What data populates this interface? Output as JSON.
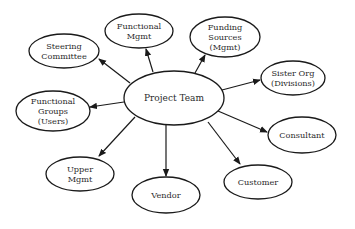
{
  "diagram": {
    "title": "",
    "background": "#ffffff",
    "stroke_color": "#1a1a1a",
    "text_color": "#2a2a2a",
    "center": {
      "id": "project-team",
      "lines": [
        "Project Team"
      ],
      "cx": 174,
      "cy": 98,
      "rx": 50,
      "ry": 27
    },
    "nodes": [
      {
        "id": "steering-committee",
        "lines": [
          "Steering",
          "Committee"
        ],
        "cx": 64,
        "cy": 51,
        "rx": 35,
        "ry": 17,
        "edge": {
          "x1": 130,
          "y1": 83,
          "x2": 99,
          "y2": 59
        }
      },
      {
        "id": "functional-mgmt",
        "lines": [
          "Functional",
          "Mgmt"
        ],
        "cx": 139,
        "cy": 31,
        "rx": 34,
        "ry": 17,
        "edge": {
          "x1": 153,
          "y1": 72,
          "x2": 146,
          "y2": 49
        }
      },
      {
        "id": "funding-sources",
        "lines": [
          "Funding",
          "Sources",
          "(Mgmt)"
        ],
        "cx": 225,
        "cy": 37,
        "rx": 35,
        "ry": 20,
        "edge": {
          "x1": 195,
          "y1": 73,
          "x2": 205,
          "y2": 55
        }
      },
      {
        "id": "sister-org",
        "lines": [
          "Sister Org",
          "(Divisions)"
        ],
        "cx": 293,
        "cy": 78,
        "rx": 32,
        "ry": 17,
        "edge": {
          "x1": 222,
          "y1": 90,
          "x2": 260,
          "y2": 80
        }
      },
      {
        "id": "consultant",
        "lines": [
          "Consultant"
        ],
        "cx": 302,
        "cy": 135,
        "rx": 34,
        "ry": 18,
        "edge": {
          "x1": 218,
          "y1": 111,
          "x2": 267,
          "y2": 132
        }
      },
      {
        "id": "customer",
        "lines": [
          "Customer"
        ],
        "cx": 258,
        "cy": 182,
        "rx": 34,
        "ry": 17,
        "edge": {
          "x1": 208,
          "y1": 122,
          "x2": 240,
          "y2": 164
        }
      },
      {
        "id": "vendor",
        "lines": [
          "Vendor"
        ],
        "cx": 166,
        "cy": 195,
        "rx": 34,
        "ry": 18,
        "edge": {
          "x1": 166,
          "y1": 125,
          "x2": 166,
          "y2": 176
        }
      },
      {
        "id": "upper-mgmt",
        "lines": [
          "Upper",
          "Mgmt"
        ],
        "cx": 80,
        "cy": 174,
        "rx": 34,
        "ry": 17,
        "edge": {
          "x1": 135,
          "y1": 117,
          "x2": 99,
          "y2": 156
        }
      },
      {
        "id": "functional-groups",
        "lines": [
          "Functional",
          "Groups",
          "(Users)"
        ],
        "cx": 53,
        "cy": 111,
        "rx": 37,
        "ry": 20,
        "edge": {
          "x1": 124,
          "y1": 102,
          "x2": 90,
          "y2": 107
        }
      }
    ]
  }
}
